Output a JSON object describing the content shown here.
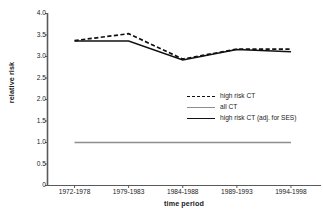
{
  "chart_data": {
    "type": "line",
    "title": "",
    "xlabel": "time period",
    "ylabel": "relative risk",
    "categories": [
      "1972-1978",
      "1979-1983",
      "1984-1988",
      "1989-1993",
      "1994-1998"
    ],
    "ylim": [
      0,
      4.0
    ],
    "yticks": [
      "0",
      "0.5",
      "1.0",
      "1.5",
      "2.0",
      "2.5",
      "3.0",
      "3.5",
      "4.0"
    ],
    "ytick_values": [
      0,
      0.5,
      1.0,
      1.5,
      2.0,
      2.5,
      3.0,
      3.5,
      4.0
    ],
    "grid": false,
    "legend_position": "center-right",
    "series": [
      {
        "name": "high risk CT",
        "style": "dashed",
        "color": "#111111",
        "values": [
          3.37,
          3.53,
          2.94,
          3.17,
          3.17
        ]
      },
      {
        "name": "all CT",
        "style": "solid",
        "color": "#8d8d8d",
        "values": [
          1.0,
          1.0,
          1.0,
          1.0,
          1.0
        ]
      },
      {
        "name": "high risk CT (adj. for SES)",
        "style": "solid",
        "color": "#111111",
        "values": [
          3.36,
          3.36,
          2.92,
          3.16,
          3.11
        ]
      }
    ]
  },
  "axis": {
    "ylabel": "relative risk",
    "xlabel": "time period"
  },
  "legend": {
    "items": [
      {
        "label": "high risk CT"
      },
      {
        "label": "all CT"
      },
      {
        "label": "high risk CT (adj. for SES)"
      }
    ]
  },
  "colors": {
    "axis": "#5a5a5a",
    "series_dark": "#111111",
    "series_gray": "#8d8d8d",
    "text": "#1a1a1a",
    "background": "#ffffff"
  }
}
